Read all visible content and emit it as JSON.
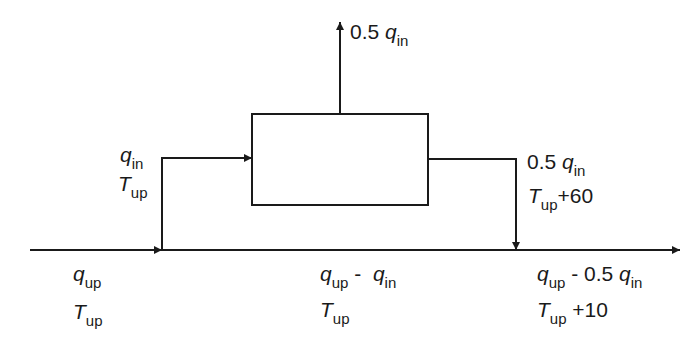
{
  "diagram": {
    "type": "flow-schematic",
    "colors": {
      "line": "#1a1a1a",
      "background": "#ffffff"
    },
    "labels": {
      "top_outlet": {
        "coef": "0.5",
        "var": "q",
        "sub": "in"
      },
      "inlet_branch": {
        "flow": {
          "var": "q",
          "sub": "in"
        },
        "temp": {
          "var": "T",
          "sub": "up"
        }
      },
      "right_outlet": {
        "flow": {
          "coef": "0.5",
          "var": "q",
          "sub": "in"
        },
        "temp": {
          "var": "T",
          "sub": "up",
          "suffix": "+60"
        }
      },
      "upstream": {
        "flow": {
          "var": "q",
          "sub": "up"
        },
        "temp": {
          "var": "T",
          "sub": "up"
        }
      },
      "middle": {
        "flow": {
          "var1": "q",
          "sub1": "up",
          "op": "-",
          "var2": "q",
          "sub2": "in"
        },
        "temp": {
          "var": "T",
          "sub": "up"
        }
      },
      "downstream": {
        "flow": {
          "var1": "q",
          "sub1": "up",
          "op": "- 0.5",
          "var2": "q",
          "sub2": "in"
        },
        "temp": {
          "var": "T",
          "sub": "up",
          "suffix": "+10"
        }
      }
    }
  }
}
